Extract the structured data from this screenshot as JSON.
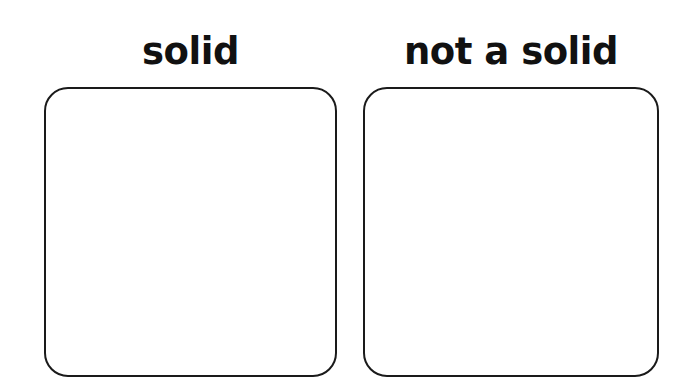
{
  "sort_sheet": {
    "columns": [
      {
        "heading": "solid"
      },
      {
        "heading": "not a solid"
      }
    ]
  }
}
